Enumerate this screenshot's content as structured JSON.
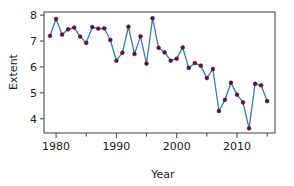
{
  "chart_data": {
    "type": "line",
    "title": "",
    "xlabel": "Year",
    "ylabel": "Extent",
    "xlim": [
      1978.0,
      2016.3
    ],
    "ylim": [
      3.45,
      8.12
    ],
    "grid": false,
    "legend": null,
    "x_ticks_major": [
      1980,
      1990,
      2000,
      2010
    ],
    "x_ticks_major_labels": [
      "1980",
      "1990",
      "2000",
      "2010"
    ],
    "x_ticks_minor": [
      1985,
      1995,
      2005,
      2015
    ],
    "y_ticks_major": [
      4,
      5,
      6,
      7,
      8
    ],
    "y_ticks_major_labels": [
      "4",
      "5",
      "6",
      "7",
      "8"
    ],
    "marker_color": "#5a1436",
    "line_color": "#3b78b5",
    "axis_color": "#4d4d4d",
    "x": [
      1979,
      1980,
      1981,
      1982,
      1983,
      1984,
      1985,
      1986,
      1987,
      1988,
      1989,
      1990,
      1991,
      1992,
      1993,
      1994,
      1995,
      1996,
      1997,
      1998,
      1999,
      2000,
      2001,
      2002,
      2003,
      2004,
      2005,
      2006,
      2007,
      2008,
      2009,
      2010,
      2011,
      2012,
      2013,
      2014,
      2015
    ],
    "values": [
      7.2,
      7.85,
      7.25,
      7.45,
      7.52,
      7.17,
      6.93,
      7.54,
      7.48,
      7.49,
      7.04,
      6.24,
      6.55,
      7.55,
      6.5,
      7.18,
      6.13,
      7.88,
      6.74,
      6.56,
      6.24,
      6.32,
      6.75,
      5.96,
      6.15,
      6.05,
      5.57,
      5.92,
      4.3,
      4.73,
      5.39,
      4.93,
      4.63,
      3.63,
      5.35,
      5.29,
      4.68
    ],
    "series_name": "Extent",
    "units": ""
  },
  "axis_titles": {
    "x": "Year",
    "y": "Extent"
  }
}
